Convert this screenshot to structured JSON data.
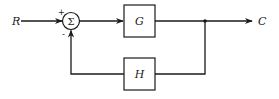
{
  "diagram": {
    "type": "feedback-control-block-diagram",
    "input_label": "R",
    "output_label": "C",
    "summing_junction": {
      "symbol": "Σ",
      "plus_sign": "+",
      "minus_sign": "-"
    },
    "forward_block": {
      "label": "G"
    },
    "feedback_block": {
      "label": "H"
    },
    "connections": [
      {
        "from": "R",
        "to": "summing_junction",
        "sign": "+"
      },
      {
        "from": "summing_junction",
        "to": "G"
      },
      {
        "from": "G",
        "to": "C"
      },
      {
        "from": "C",
        "to": "H",
        "via": "takeoff_point"
      },
      {
        "from": "H",
        "to": "summing_junction",
        "sign": "-"
      }
    ],
    "color": "#1a1a1a"
  }
}
